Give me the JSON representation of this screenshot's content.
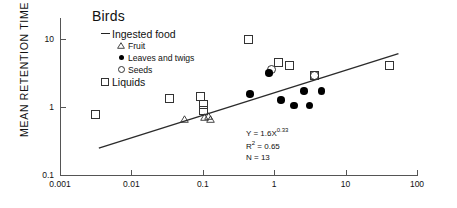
{
  "chart_data": {
    "type": "scatter",
    "title": "Birds",
    "xlabel": "",
    "ylabel": "MEAN RETENTION TIME (hr)",
    "xscale": "log",
    "yscale": "log",
    "xlim": [
      0.001,
      100
    ],
    "ylim": [
      0.1,
      20
    ],
    "xticks": [
      "0.001",
      "0.01",
      "0.1",
      "1",
      "10",
      "100"
    ],
    "yticks": [
      "10",
      "1",
      "0.1"
    ],
    "grid": false,
    "legend_position": "top-left-inside",
    "legend": {
      "title": "Birds",
      "entries": [
        {
          "label": "Ingested food",
          "symbol": "dash",
          "level": 1
        },
        {
          "label": "Fruit",
          "symbol": "triangle-open",
          "level": 2
        },
        {
          "label": "Leaves and twigs",
          "symbol": "circle-filled",
          "level": 2
        },
        {
          "label": "Seeds",
          "symbol": "circle-open",
          "level": 2
        },
        {
          "label": "Liquids",
          "symbol": "square-open",
          "level": 1
        }
      ]
    },
    "annotations": {
      "equation": "Y = 1.6X",
      "equation_exponent": "0.33",
      "r2_label": "R",
      "r2_exponent": "2",
      "r2_value": " = 0.65",
      "n_text": "N = 13"
    },
    "fit_line": {
      "type": "power",
      "coefficient": 1.6,
      "exponent": 0.33,
      "r_squared": 0.65,
      "n": 13,
      "x_start": 0.0035,
      "x_end": 55
    },
    "series": [
      {
        "name": "Liquids",
        "symbol": "square-open",
        "points": [
          {
            "x": 0.003,
            "y": 0.8
          },
          {
            "x": 0.033,
            "y": 1.35
          },
          {
            "x": 0.09,
            "y": 1.45
          },
          {
            "x": 0.1,
            "y": 1.1
          },
          {
            "x": 0.1,
            "y": 0.92
          },
          {
            "x": 0.42,
            "y": 10.0
          },
          {
            "x": 1.1,
            "y": 4.6
          },
          {
            "x": 1.6,
            "y": 4.2
          },
          {
            "x": 3.5,
            "y": 3.0
          },
          {
            "x": 40.0,
            "y": 4.2
          }
        ]
      },
      {
        "name": "Fruit",
        "symbol": "triangle-open",
        "points": [
          {
            "x": 0.055,
            "y": 0.58
          },
          {
            "x": 0.105,
            "y": 0.62
          },
          {
            "x": 0.12,
            "y": 0.66
          },
          {
            "x": 0.125,
            "y": 0.58
          }
        ]
      },
      {
        "name": "Seeds",
        "symbol": "circle-open",
        "points": [
          {
            "x": 0.9,
            "y": 3.6
          },
          {
            "x": 3.6,
            "y": 3.0
          }
        ]
      },
      {
        "name": "Leaves and twigs",
        "symbol": "circle-filled",
        "points": [
          {
            "x": 0.46,
            "y": 1.55
          },
          {
            "x": 0.85,
            "y": 3.1
          },
          {
            "x": 1.25,
            "y": 1.25
          },
          {
            "x": 1.9,
            "y": 1.05
          },
          {
            "x": 2.6,
            "y": 1.7
          },
          {
            "x": 3.1,
            "y": 1.05
          },
          {
            "x": 4.6,
            "y": 1.7
          }
        ]
      }
    ]
  }
}
